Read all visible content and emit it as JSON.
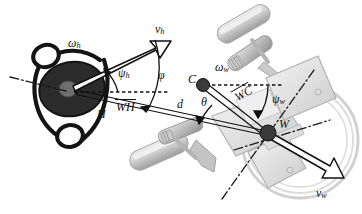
{
  "figure": {
    "background": "#ffffff",
    "width": 362,
    "height": 214,
    "colors": {
      "ink": "#111111",
      "human_fill": "#2b2b2b",
      "point_fill": "#3a3a3a",
      "wheelchair_gray": "#b8b8b8",
      "wheelchair_light": "#dcdcdc",
      "wheelchair_mid": "#9a9a9a",
      "dash_axis": "#1a1a1a"
    }
  },
  "labels": {
    "omega_h": {
      "base": "ω",
      "sub": "h",
      "x": 70,
      "y": 45,
      "name": "human-angular-velocity-label"
    },
    "v_h": {
      "base": "v",
      "sub": "h",
      "x": 157,
      "y": 30,
      "name": "human-linear-velocity-label"
    },
    "psi_h": {
      "base": "ψ",
      "sub": "h",
      "x": 117,
      "y": 74,
      "name": "human-heading-angle-label"
    },
    "phi": {
      "base": "φ",
      "sub": "",
      "x": 157,
      "y": 76,
      "name": "phi-angle-label"
    },
    "H": {
      "base": "H",
      "sub": "",
      "x": 96,
      "y": 112,
      "name": "human-point-label"
    },
    "WH": {
      "base": "WH",
      "sub": "",
      "x": 117,
      "y": 104,
      "name": "wh-vector-label",
      "overline": true
    },
    "d": {
      "base": "d",
      "sub": "",
      "x": 176,
      "y": 102,
      "name": "distance-label"
    },
    "theta": {
      "base": "θ",
      "sub": "",
      "x": 200,
      "y": 100,
      "name": "theta-angle-label"
    },
    "C": {
      "base": "C",
      "sub": "",
      "x": 190,
      "y": 76,
      "name": "chair-center-point-label"
    },
    "omega_w": {
      "base": "ω",
      "sub": "w",
      "x": 216,
      "y": 68,
      "name": "wheelchair-angular-velocity-label"
    },
    "WC": {
      "base": "WC",
      "sub": "",
      "x": 233,
      "y": 95,
      "name": "wc-vector-label",
      "overline": true
    },
    "psi_w": {
      "base": "ψ",
      "sub": "w",
      "x": 274,
      "y": 97,
      "name": "wheelchair-heading-angle-label"
    },
    "W": {
      "base": "W",
      "sub": "",
      "x": 277,
      "y": 121,
      "name": "wheel-axis-point-label"
    },
    "v_w": {
      "base": "v",
      "sub": "w",
      "x": 317,
      "y": 192,
      "name": "wheelchair-linear-velocity-label"
    }
  },
  "points": [
    {
      "id": "H",
      "name": "point-H",
      "x": 72,
      "y": 89,
      "r": 6
    },
    {
      "id": "C",
      "name": "point-C",
      "x": 203,
      "y": 85,
      "r": 6
    },
    {
      "id": "W",
      "name": "point-W",
      "x": 268,
      "y": 133,
      "r": 7
    }
  ],
  "vectors": [
    {
      "id": "v_h",
      "name": "vector-v-h",
      "from": [
        72,
        89
      ],
      "to": [
        163,
        48
      ],
      "style": "open-block-arrow"
    },
    {
      "id": "v_w",
      "name": "vector-v-w",
      "from": [
        268,
        133
      ],
      "to": [
        340,
        176
      ],
      "style": "open-block-arrow"
    },
    {
      "id": "WH",
      "name": "vector-WH",
      "from": [
        268,
        133
      ],
      "to": [
        74,
        92
      ],
      "style": "thin-double-line"
    },
    {
      "id": "WC",
      "name": "vector-WC",
      "from": [
        203,
        85
      ],
      "to": [
        268,
        133
      ],
      "style": "thin-double-line"
    }
  ],
  "dashed_lines": [
    {
      "id": "h-ref",
      "name": "dashed-reference-human",
      "from": [
        72,
        92
      ],
      "to": [
        166,
        92
      ]
    },
    {
      "id": "c-ref",
      "name": "dashed-reference-chair",
      "from": [
        203,
        85
      ],
      "to": [
        283,
        85
      ]
    }
  ],
  "angle_arcs": [
    {
      "id": "psi_h",
      "name": "arc-psi-h",
      "center": [
        72,
        90
      ],
      "radius": 48,
      "label": "ψh"
    },
    {
      "id": "phi",
      "name": "arc-phi",
      "center": [
        72,
        90
      ],
      "radius": 92,
      "label": "φ"
    },
    {
      "id": "theta",
      "name": "arc-theta",
      "center": [
        268,
        133
      ],
      "radius": 68,
      "label": "θ"
    },
    {
      "id": "psi_w",
      "name": "arc-psi-w",
      "center": [
        268,
        133
      ],
      "radius": 52,
      "label": "ψw"
    }
  ],
  "axes": [
    {
      "id": "human-axis",
      "name": "dashdot-axis-human",
      "from": [
        12,
        78
      ],
      "to": [
        70,
        92
      ]
    },
    {
      "id": "wheel-axis-1",
      "name": "dashdot-axis-wheel-major",
      "from": [
        224,
        196
      ],
      "to": [
        312,
        72
      ]
    },
    {
      "id": "wheel-axis-2",
      "name": "dashdot-axis-wheel-minor",
      "from": [
        236,
        148
      ],
      "to": [
        325,
        122
      ]
    }
  ],
  "objects": [
    {
      "id": "human",
      "name": "human-top-view-outline",
      "desc": "black line drawing of a person seen from above: head ellipse, shoulders and two arms"
    },
    {
      "id": "wheelchair-back",
      "name": "wheelchair-render-upper",
      "desc": "grayscale 3D rendered wheelchair arm and handle, upper right"
    },
    {
      "id": "wheelchair-front",
      "name": "wheelchair-render-lower",
      "desc": "grayscale 3D rendered wheelchair seat, footrest and drive wheel, lower middle"
    },
    {
      "id": "drive-wheel",
      "name": "wheelchair-drive-wheel",
      "desc": "large light gray wheel rim circle on the right"
    }
  ]
}
